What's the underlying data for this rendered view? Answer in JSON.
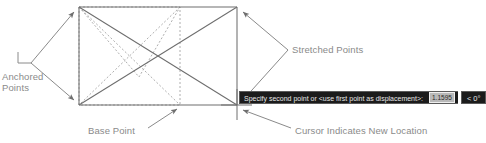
{
  "figure": {
    "type": "autocad-stretch-illustration",
    "background_color": "#ffffff",
    "line_color": "#6e6e6e",
    "dashed_color": "#9a9a9a",
    "label_color": "#8a8a8a"
  },
  "labels": {
    "anchored_points": "Anchored\nPoints",
    "stretched_points": "Stretched Points",
    "base_point": "Base Point",
    "cursor_new_location": "Cursor Indicates New Location"
  },
  "tooltip": {
    "prompt": "Specify second point or <use first point as displacement>:",
    "value": "1.1595",
    "angle": "< 0°",
    "background_color": "#1b1b1b",
    "text_color": "#e8e8e8",
    "field_background": "#b9b9b9"
  },
  "icons": {
    "cursor": "crosshair-cursor-icon",
    "leader_arrow": "leader-arrow-icon"
  }
}
